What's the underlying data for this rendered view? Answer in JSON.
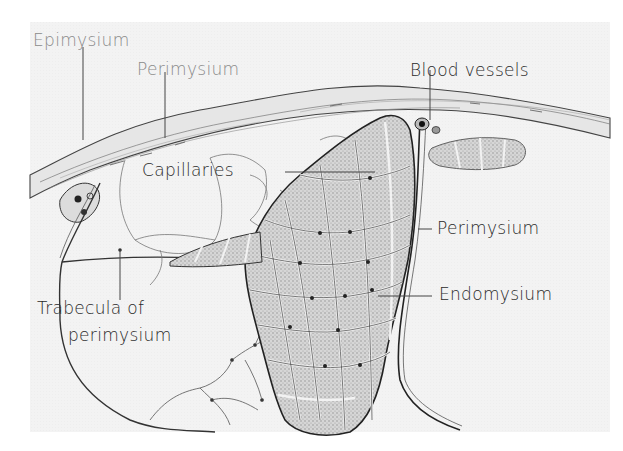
{
  "figure": {
    "labels": {
      "epimysium": "Epimysium",
      "perimysium_top": "Perimysium",
      "blood_vessels": "Blood vessels",
      "capillaries": "Capillaries",
      "perimysium_right": "Perimysium",
      "endomysium": "Endomysium",
      "trabecula_line1": "Trabecula of",
      "trabecula_line2": "perimysium"
    },
    "colors": {
      "background": "#ffffff",
      "paper": "#f3f3f3",
      "ink": "#2a2a2a",
      "faint_ink": "#8a8a8a",
      "fiber_fill": "#cfcfcf"
    }
  }
}
